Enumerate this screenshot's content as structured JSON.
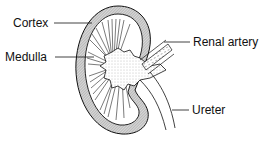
{
  "diagram": {
    "labels": {
      "cortex": "Cortex",
      "medulla": "Medulla",
      "renal_artery": "Renal artery",
      "ureter": "Ureter"
    },
    "colors": {
      "line": "#111111",
      "hatch": "#9a9a9a",
      "background": "#ffffff"
    }
  }
}
